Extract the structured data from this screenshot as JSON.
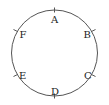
{
  "diagram": {
    "type": "circle-with-labeled-points",
    "stroke_color": "#555555",
    "label_color": "#222222",
    "circle": {
      "cx": 54.5,
      "cy": 53,
      "r": 43
    },
    "points": [
      {
        "label": "A",
        "angle_deg": 90
      },
      {
        "label": "B",
        "angle_deg": 30
      },
      {
        "label": "C",
        "angle_deg": -30
      },
      {
        "label": "D",
        "angle_deg": -90
      },
      {
        "label": "E",
        "angle_deg": -150
      },
      {
        "label": "F",
        "angle_deg": 150
      }
    ]
  }
}
